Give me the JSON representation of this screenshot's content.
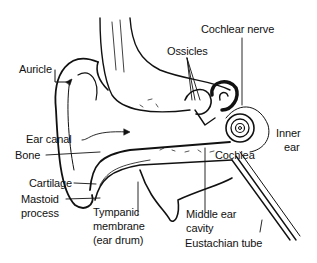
{
  "diagram": {
    "labels": {
      "auricle": "Auricle",
      "ossicles": "Ossicles",
      "cochlear_nerve": "Cochlear nerve",
      "ear_canal": "Ear canal",
      "bone": "Bone",
      "cochlea": "Cochlea",
      "inner_ear_1": "Inner",
      "inner_ear_2": "ear",
      "cartilage": "Cartilage",
      "mastoid_1": "Mastoid",
      "mastoid_2": "process",
      "tympanic_1": "Tympanic",
      "tympanic_2": "membrane",
      "tympanic_3": "(ear drum)",
      "middle_ear_1": "Middle ear",
      "middle_ear_2": "cavity",
      "eustachian": "Eustachian tube"
    },
    "colors": {
      "ink": "#111111",
      "background": "#ffffff"
    }
  }
}
